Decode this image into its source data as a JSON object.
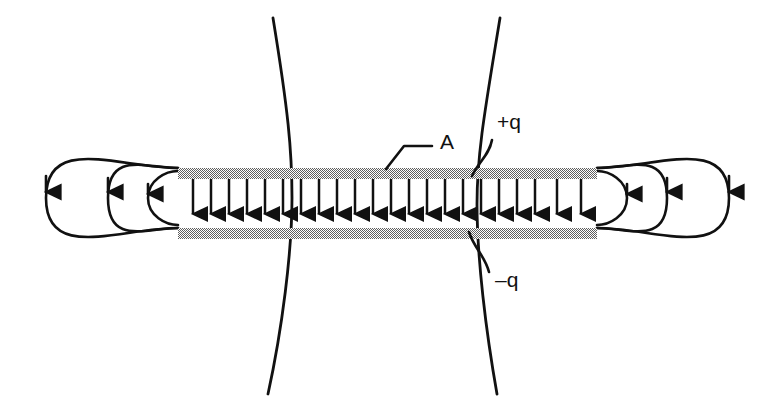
{
  "figure": {
    "background_color": "#ffffff",
    "line_color": "#111111",
    "plate_color": "#8c8c8c",
    "width": 767,
    "height": 412
  },
  "labels": {
    "area": "A",
    "positive_charge": "+q",
    "negative_charge": "–q"
  },
  "label_positions": {
    "area": {
      "x": 440,
      "y": 149
    },
    "positive_charge": {
      "x": 497,
      "y": 129
    },
    "negative_charge": {
      "x": 495,
      "y": 287
    }
  },
  "plates": {
    "count": 2,
    "left_x": 178,
    "right_x": 597,
    "thickness": 11,
    "top_plate_y": 168,
    "bottom_plate_y": 228,
    "top_plate_label": "+q",
    "bottom_plate_label": "–q",
    "fill": "#8c8c8c"
  },
  "interior_field": {
    "description": "uniform downward electric field between the plates",
    "arrow_count": 22,
    "direction": "down",
    "start_x": 192,
    "end_x": 586,
    "top_y": 179,
    "bottom_y": 228
  },
  "fringe_loops": {
    "description": "three nested closed field-line loops at each plate end",
    "per_side": 3,
    "sides": [
      "left",
      "right"
    ],
    "left_radii_x": [
      32,
      96,
      158
    ],
    "right_radii_x": [
      32,
      96,
      158
    ],
    "radii_y": [
      30,
      92,
      148
    ]
  },
  "gaussian_curves": {
    "description": "two curved surfaces crossing both plates",
    "count": 2,
    "left_curve": {
      "top_x": 273,
      "mid_x": 292,
      "bottom_x": 268
    },
    "right_curve": {
      "top_x": 500,
      "mid_x": 477,
      "bottom_x": 497
    },
    "top_y": 18,
    "bottom_y": 394
  },
  "leader_lines": {
    "area": {
      "from_x": 430,
      "to_x": 386,
      "bend_x": 404,
      "top_y": 146,
      "bottom_y": 168
    },
    "positive_charge": {
      "from_x": 492,
      "to_x": 470,
      "y_end": 178
    },
    "negative_charge": {
      "from_x": 489,
      "to_x": 468,
      "y_end": 230
    }
  }
}
